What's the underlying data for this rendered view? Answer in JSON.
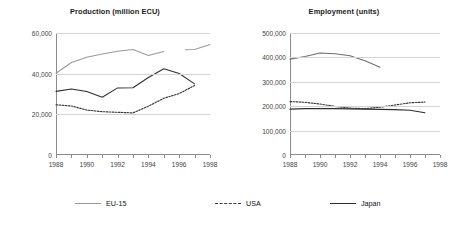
{
  "legend": {
    "position": "bottom",
    "items": [
      {
        "label": "EU-15",
        "style": "solid",
        "color": "#9a9a9a"
      },
      {
        "label": "USA",
        "style": "dotted",
        "color": "#3a3a3a"
      },
      {
        "label": "Japan",
        "style": "solid",
        "color": "#2e2e2e"
      }
    ]
  },
  "chart_data": [
    {
      "type": "line",
      "title": "Production (million ECU)",
      "xlabel": "",
      "ylabel": "",
      "xlim": [
        1988,
        1998
      ],
      "ylim": [
        0,
        60000
      ],
      "yticks": [
        0,
        20000,
        40000,
        60000
      ],
      "ytick_labels": [
        "0",
        "20,000",
        "40,000",
        "60,000"
      ],
      "xticks": [
        1988,
        1989,
        1990,
        1991,
        1992,
        1993,
        1994,
        1995,
        1996,
        1997,
        1998
      ],
      "xtick_labels": [
        "1988",
        "",
        "1990",
        "",
        "1992",
        "",
        "1994",
        "",
        "1996",
        "",
        "1998"
      ],
      "grid": true,
      "series": [
        {
          "name": "EU-15",
          "style": "solid",
          "color": "#9a9a9a",
          "x": [
            1988,
            1989,
            1990,
            1991,
            1992,
            1993,
            1994,
            1995,
            1996.4,
            1997,
            1998
          ],
          "values": [
            40200,
            45500,
            48100,
            49700,
            51000,
            51900,
            48900,
            50900,
            51800,
            51900,
            54400
          ],
          "gap_after_index": 7
        },
        {
          "name": "Japan",
          "style": "solid",
          "color": "#2e2e2e",
          "x": [
            1988,
            1989,
            1990,
            1991,
            1992,
            1993,
            1994,
            1995,
            1996,
            1997
          ],
          "values": [
            31300,
            32500,
            31200,
            28400,
            33000,
            33100,
            38100,
            42400,
            40100,
            35000
          ]
        },
        {
          "name": "USA",
          "style": "dotted",
          "color": "#3a3a3a",
          "x": [
            1988,
            1989,
            1990,
            1991,
            1992,
            1993,
            1994,
            1995,
            1996,
            1997
          ],
          "values": [
            24700,
            24100,
            22100,
            21300,
            21000,
            20700,
            24000,
            27900,
            30200,
            34200
          ]
        }
      ]
    },
    {
      "type": "line",
      "title": "Employment (units)",
      "xlabel": "",
      "ylabel": "",
      "xlim": [
        1988,
        1998
      ],
      "ylim": [
        0,
        500000
      ],
      "yticks": [
        0,
        100000,
        200000,
        300000,
        400000,
        500000
      ],
      "ytick_labels": [
        "0",
        "100,000",
        "200,000",
        "300,000",
        "400,000",
        "500,000"
      ],
      "xticks": [
        1988,
        1989,
        1990,
        1991,
        1992,
        1993,
        1994,
        1995,
        1996,
        1997,
        1998
      ],
      "xtick_labels": [
        "1988",
        "",
        "1990",
        "",
        "1992",
        "",
        "1994",
        "",
        "1996",
        "",
        "1998"
      ],
      "grid": true,
      "series": [
        {
          "name": "EU-15",
          "style": "solid",
          "color": "#6e6e6e",
          "x": [
            1988,
            1989,
            1990,
            1991,
            1992,
            1993,
            1994
          ],
          "values": [
            393000,
            404000,
            418000,
            415000,
            407000,
            386000,
            360000
          ]
        },
        {
          "name": "USA",
          "style": "dotted",
          "color": "#3a3a3a",
          "x": [
            1988,
            1989,
            1990,
            1991,
            1992,
            1993,
            1994,
            1995,
            1996,
            1997
          ],
          "values": [
            219000,
            216000,
            209000,
            199000,
            192000,
            190000,
            196000,
            205000,
            214000,
            217000
          ]
        },
        {
          "name": "Japan",
          "style": "solid",
          "color": "#2e2e2e",
          "x": [
            1988,
            1989,
            1990,
            1991,
            1992,
            1993,
            1994,
            1995,
            1996,
            1997
          ],
          "values": [
            188000,
            190000,
            191000,
            190000,
            189000,
            188000,
            187000,
            186000,
            183000,
            173000
          ]
        }
      ]
    }
  ]
}
